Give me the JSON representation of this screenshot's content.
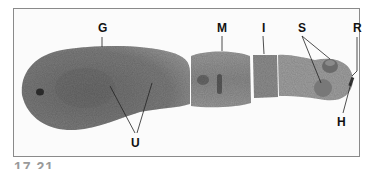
{
  "figure": {
    "number": "17.21",
    "labels": {
      "G": "G",
      "U": "U",
      "M": "M",
      "I": "I",
      "S": "S",
      "R": "R",
      "H": "H"
    }
  }
}
